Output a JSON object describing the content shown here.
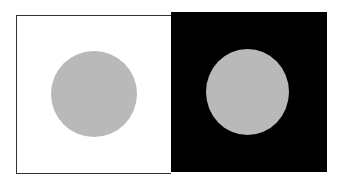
{
  "illustration": {
    "description": "Simultaneous contrast: identical gray circles on white and black backgrounds",
    "left_panel": {
      "background": "#ffffff",
      "circle_color": "#b9b9b9"
    },
    "right_panel": {
      "background": "#000000",
      "circle_color": "#b9b9b9"
    }
  }
}
